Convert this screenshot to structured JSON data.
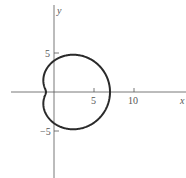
{
  "chart_data": {
    "type": "line",
    "subtype": "polar-curve",
    "title": "",
    "curve": "limacon r = 4 + 3cos(theta)",
    "xlabel": "x",
    "ylabel": "y",
    "xticks": [
      5,
      10
    ],
    "xtick_labels": [
      "5",
      "10"
    ],
    "yticks": [
      5,
      -5
    ],
    "ytick_labels": [
      "5",
      "−5"
    ],
    "xlim": [
      -6.5,
      16
    ],
    "ylim": [
      -10.5,
      11.5
    ],
    "grid": false,
    "legend": null,
    "key_points": [
      {
        "x": 7,
        "y": 0
      },
      {
        "x": -1,
        "y": 0
      },
      {
        "x": 0,
        "y": 4
      },
      {
        "x": 0,
        "y": -4
      }
    ],
    "style": {
      "curve_color": "#2a2a2a",
      "axis_color": "#555555"
    }
  }
}
